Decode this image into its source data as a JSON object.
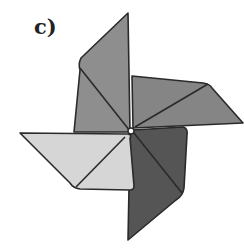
{
  "figure": {
    "label": "c)",
    "colors": {
      "top_blade": "#8e8e8e",
      "top_blade_fold": "#9a9a9a",
      "right_blade": "#858585",
      "right_blade_fold": "#939393",
      "bottom_blade": "#555555",
      "bottom_blade_fold": "#626262",
      "left_blade": "#d6d6d6",
      "left_blade_fold": "#c8c8c8",
      "outline": "#2a2a2a"
    }
  }
}
